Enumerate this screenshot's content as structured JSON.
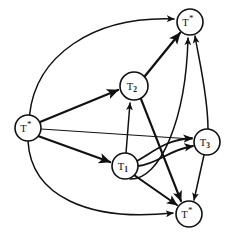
{
  "figure": {
    "background_color": "#ffffff",
    "line_color": "#111111"
  },
  "nodes": [
    {
      "id": "t-source",
      "label": "T",
      "mark": "*",
      "sub": "",
      "cx": 28,
      "cy": 128,
      "r": 13
    },
    {
      "id": "t-top",
      "label": "T",
      "mark": "*",
      "sub": "",
      "cx": 190,
      "cy": 22,
      "r": 13
    },
    {
      "id": "t-bottom",
      "label": "T",
      "mark": "*",
      "sub": "",
      "cx": 189,
      "cy": 214,
      "r": 13
    },
    {
      "id": "t1",
      "label": "T",
      "mark": "",
      "sub": "1",
      "cx": 125,
      "cy": 166,
      "r": 13
    },
    {
      "id": "t2",
      "label": "T",
      "mark": "",
      "sub": "2",
      "cx": 134,
      "cy": 86,
      "r": 14
    },
    {
      "id": "t3",
      "label": "T",
      "mark": "",
      "sub": "3",
      "cx": 207,
      "cy": 142,
      "r": 13
    }
  ],
  "edges": [
    {
      "id": "e-source-top",
      "from": "t-source",
      "to": "t-top",
      "style": "curved"
    },
    {
      "id": "e-source-t2",
      "from": "t-source",
      "to": "t2",
      "style": "straight"
    },
    {
      "id": "e-source-t3",
      "from": "t-source",
      "to": "t3",
      "style": "straight"
    },
    {
      "id": "e-source-t1",
      "from": "t-source",
      "to": "t1",
      "style": "straight"
    },
    {
      "id": "e-source-bottom",
      "from": "t-source",
      "to": "t-bottom",
      "style": "curved"
    },
    {
      "id": "e-t1-t2",
      "from": "t1",
      "to": "t2",
      "style": "straight"
    },
    {
      "id": "e-t1-t3-upper",
      "from": "t1",
      "to": "t3",
      "style": "curved"
    },
    {
      "id": "e-t1-t3-lower",
      "from": "t1",
      "to": "t3",
      "style": "curved"
    },
    {
      "id": "e-t1-bottom",
      "from": "t1",
      "to": "t-bottom",
      "style": "straight"
    },
    {
      "id": "e-t1-top",
      "from": "t1",
      "to": "t-top",
      "style": "curved"
    },
    {
      "id": "e-t2-top",
      "from": "t2",
      "to": "t-top",
      "style": "straight"
    },
    {
      "id": "e-t2-bottom",
      "from": "t2",
      "to": "t-bottom",
      "style": "straight"
    },
    {
      "id": "e-t3-top",
      "from": "t3",
      "to": "t-top",
      "style": "straight"
    },
    {
      "id": "e-t3-bottom",
      "from": "t3",
      "to": "t-bottom",
      "style": "straight"
    }
  ]
}
